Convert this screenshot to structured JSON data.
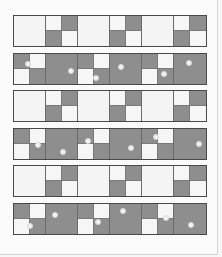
{
  "colors": {
    "light": "#f4f4f4",
    "dark": "#8e8e8e",
    "border": "#4a4a4a",
    "page": "#fbfbfb"
  },
  "quilt": {
    "rows": [
      {
        "type": "light",
        "top": 15,
        "pattern": [
          "big-light",
          "four:LDDL",
          "big-light",
          "four:LDDL",
          "big-light",
          "four:LDDL"
        ]
      },
      {
        "type": "dark",
        "top": 53,
        "pattern": [
          "four:DLLD",
          "big-dark",
          "four:DLLD",
          "big-dark",
          "four:DLLD",
          "big-dark"
        ]
      },
      {
        "type": "light",
        "top": 90,
        "pattern": [
          "big-light",
          "four:LDDL",
          "big-light",
          "four:LDDL",
          "big-light",
          "four:LDDL"
        ]
      },
      {
        "type": "dark",
        "top": 128,
        "pattern": [
          "four:DLLD",
          "big-dark",
          "four:DLLD",
          "big-dark",
          "four:DLLD",
          "big-dark"
        ]
      },
      {
        "type": "light",
        "top": 165,
        "pattern": [
          "big-light",
          "four:LDDL",
          "big-light",
          "four:LDDL",
          "big-light",
          "four:LDDL"
        ]
      },
      {
        "type": "dark",
        "top": 203,
        "pattern": [
          "four:DLLD",
          "big-dark",
          "four:DLLD",
          "big-dark",
          "four:DLLD",
          "big-dark"
        ]
      }
    ]
  }
}
